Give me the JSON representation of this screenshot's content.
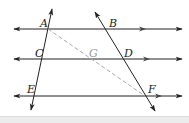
{
  "diagram": {
    "type": "geometry-parallel-lines",
    "colors": {
      "line": "#222222",
      "dashed": "#a8a8a8",
      "label": "#222222",
      "label_muted": "#9a9a9a",
      "band": "#ececec"
    },
    "points": {
      "A": {
        "label": "A",
        "x": 48,
        "y": 29
      },
      "B": {
        "label": "B",
        "x": 106,
        "y": 29
      },
      "C": {
        "label": "C",
        "x": 43,
        "y": 59
      },
      "G": {
        "label": "G",
        "x": 93,
        "y": 59
      },
      "D": {
        "label": "D",
        "x": 123,
        "y": 59
      },
      "E": {
        "label": "E",
        "x": 36,
        "y": 96
      },
      "F": {
        "label": "F",
        "x": 145,
        "y": 96
      }
    },
    "parallel_lines": [
      {
        "name": "line-AB",
        "y": 29
      },
      {
        "name": "line-CD",
        "y": 59
      },
      {
        "name": "line-EF",
        "y": 96
      }
    ],
    "transversals": [
      {
        "name": "transversal-ACE",
        "through": [
          "A",
          "C",
          "E"
        ]
      },
      {
        "name": "transversal-BDF",
        "through": [
          "B",
          "D",
          "F"
        ]
      }
    ],
    "dashed_segments": [
      {
        "name": "segment-AF",
        "through": [
          "A",
          "G",
          "F"
        ]
      }
    ]
  }
}
